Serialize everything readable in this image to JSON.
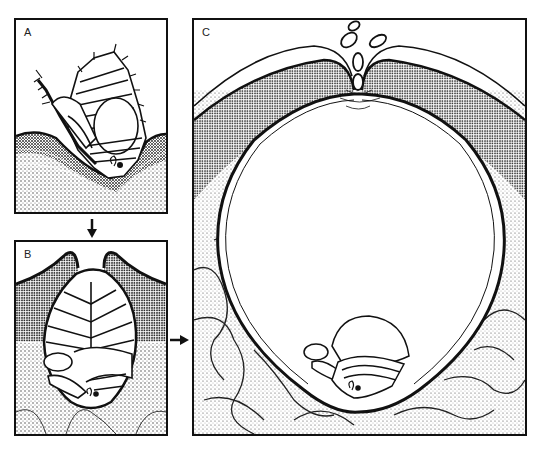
{
  "figure": {
    "panels": [
      {
        "id": "A",
        "label": "A",
        "description": "organism beginning to burrow into skin surface"
      },
      {
        "id": "B",
        "label": "B",
        "description": "organism embedded in epidermis with opening at surface"
      },
      {
        "id": "C",
        "label": "C",
        "description": "greatly enlarged body within dermis, eggs expelled through opening"
      }
    ],
    "arrows": [
      {
        "from": "A",
        "to": "B",
        "direction": "down"
      },
      {
        "from": "B",
        "to": "C",
        "direction": "right"
      }
    ],
    "colors": {
      "ink": "#111111",
      "paper": "#ffffff",
      "stipple": "#333333"
    }
  }
}
